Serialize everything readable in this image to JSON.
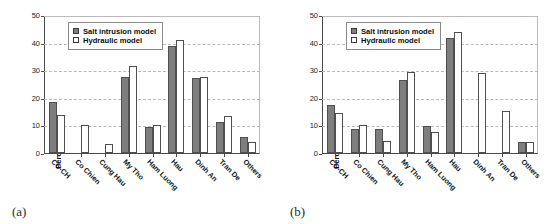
{
  "figure": {
    "width": 556,
    "height": 224,
    "colors": {
      "salt_fill": "#7e7e7e",
      "hydraulic_fill": "#ffffff",
      "bar_stroke": "#4f4f4f",
      "grid": "#b9b9b9",
      "axis": "#4a4a4a"
    }
  },
  "panels": [
    {
      "caption": "(a)",
      "chart_data": {
        "type": "bar",
        "title": "",
        "xlabel": "",
        "ylabel": "Percentage of observations (%)",
        "ylim": [
          0,
          50
        ],
        "yticks": [
          0,
          10,
          20,
          30,
          40,
          50
        ],
        "grid": true,
        "legend_position": "top-left",
        "categories": [
          "CC-CH",
          "Co Chien",
          "Cung Hau",
          "My Tho",
          "Ham Luong",
          "Hau",
          "Dinh An",
          "Tran De",
          "Others"
        ],
        "series": [
          {
            "name": "Salt intrusion model",
            "values": [
              18.5,
              0,
              0,
              27.9,
              9.4,
              39.2,
              27.5,
              11.5,
              5.9
            ]
          },
          {
            "name": "Hydraulic model",
            "values": [
              13.9,
              10.4,
              3.3,
              31.8,
              10.4,
              41.2,
              27.8,
              13.5,
              4.0
            ]
          }
        ]
      }
    },
    {
      "caption": "(b)",
      "chart_data": {
        "type": "bar",
        "title": "",
        "xlabel": "",
        "ylabel": "Percentage of observations (%)",
        "ylim": [
          0,
          50
        ],
        "yticks": [
          0,
          10,
          20,
          30,
          40,
          50
        ],
        "grid": true,
        "legend_position": "top-left",
        "categories": [
          "CC-CH",
          "Co Chien",
          "Cung Hau",
          "My Tho",
          "Ham Luong",
          "Hau",
          "Dinh An",
          "Tran De",
          "Others"
        ],
        "series": [
          {
            "name": "Salt intrusion model",
            "values": [
              17.5,
              8.8,
              8.8,
              26.8,
              9.8,
              42.0,
              0,
              0,
              4.0
            ]
          },
          {
            "name": "Hydraulic model",
            "values": [
              14.6,
              10.1,
              4.4,
              29.5,
              7.8,
              44.0,
              29.3,
              15.2,
              4.0
            ]
          }
        ]
      }
    }
  ]
}
